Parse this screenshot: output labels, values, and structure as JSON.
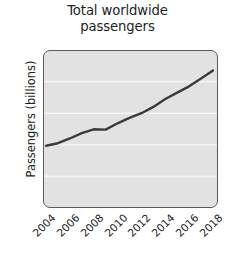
{
  "chart_data": {
    "type": "line",
    "title": "Total worldwide\npassengers",
    "title_lines": [
      "Total worldwide",
      "passengers"
    ],
    "xlabel": "",
    "ylabel": "Passengers (billions)",
    "xlim": [
      2004,
      2018
    ],
    "ylim": [
      0,
      5
    ],
    "grid": "horizontal-white",
    "legend": "none",
    "x_tick_labels": [
      "2004",
      "2006",
      "2008",
      "2010",
      "2012",
      "2014",
      "2016",
      "2018"
    ],
    "x_tick_values": [
      2004,
      2006,
      2008,
      2010,
      2012,
      2014,
      2016,
      2018
    ],
    "y_tick_labels": [
      "0",
      "1",
      "2",
      "3",
      "4",
      "5"
    ],
    "y_tick_values": [
      0,
      1,
      2,
      3,
      4,
      5
    ],
    "x": [
      2004,
      2005,
      2006,
      2007,
      2008,
      2009,
      2010,
      2011,
      2012,
      2013,
      2014,
      2015,
      2016,
      2017,
      2018
    ],
    "values": [
      1.97,
      2.05,
      2.2,
      2.37,
      2.49,
      2.48,
      2.68,
      2.85,
      3.0,
      3.2,
      3.45,
      3.65,
      3.85,
      4.1,
      4.35
    ],
    "series": [
      {
        "name": "Total worldwide passengers",
        "values": [
          1.97,
          2.05,
          2.2,
          2.37,
          2.49,
          2.48,
          2.68,
          2.85,
          3.0,
          3.2,
          3.45,
          3.65,
          3.85,
          4.1,
          4.35
        ]
      }
    ]
  },
  "colors": {
    "line": "#3b3b3b",
    "plot_background": "#e2e2e2",
    "gridline": "#f4f4f4",
    "axis_border": "#5a5a5a",
    "text": "#232323",
    "figure_background": "#ffffff"
  }
}
